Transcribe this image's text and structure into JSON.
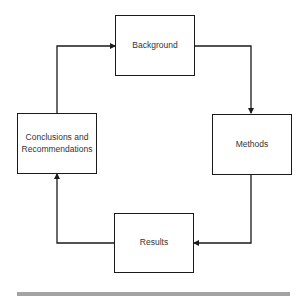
{
  "diagram": {
    "type": "cycle-flowchart",
    "nodes": [
      {
        "id": "background",
        "label": "Background"
      },
      {
        "id": "methods",
        "label": "Methods"
      },
      {
        "id": "results",
        "label": "Results"
      },
      {
        "id": "conclusions",
        "label": "Conclusions and Recommendations"
      }
    ],
    "edges": [
      {
        "from": "background",
        "to": "methods"
      },
      {
        "from": "methods",
        "to": "results"
      },
      {
        "from": "results",
        "to": "conclusions"
      },
      {
        "from": "conclusions",
        "to": "background"
      }
    ],
    "colors": {
      "stroke": "#1a1a1a",
      "text": "#333333",
      "bar": "#a3a3a3"
    }
  }
}
